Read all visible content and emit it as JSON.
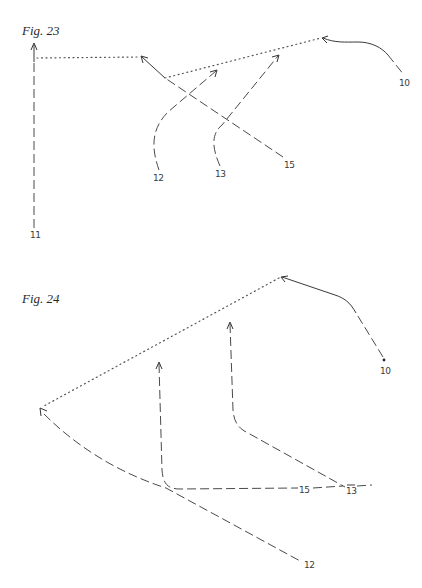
{
  "figures": [
    {
      "title": "Fig. 23",
      "labels": {
        "l10": "10",
        "l11": "11",
        "l12": "12",
        "l13": "13",
        "l15": "15"
      }
    },
    {
      "title": "Fig. 24",
      "labels": {
        "l10": "10",
        "l12": "12",
        "l13": "13",
        "l15": "15"
      }
    }
  ],
  "colors": {
    "ink": "#3a3a3a",
    "background": "#ffffff"
  }
}
